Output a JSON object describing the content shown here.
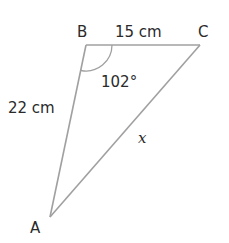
{
  "diagram": {
    "type": "triangle",
    "vertices": {
      "A": {
        "label": "A"
      },
      "B": {
        "label": "B"
      },
      "C": {
        "label": "C"
      }
    },
    "sides": {
      "AB": {
        "label": "22 cm"
      },
      "BC": {
        "label": "15 cm"
      },
      "AC": {
        "label": "x"
      }
    },
    "angles": {
      "B": {
        "label": "102°"
      }
    },
    "colors": {
      "edge": "#a0a0a0",
      "text": "#2a2a2a"
    }
  }
}
